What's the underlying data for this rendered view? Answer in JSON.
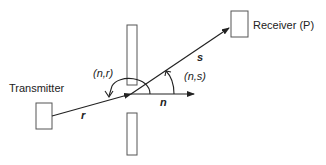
{
  "diagram": {
    "labels": {
      "transmitter": "Transmitter",
      "receiver": "Receiver (P)",
      "vector_r": "r",
      "vector_s": "s",
      "vector_n": "n",
      "angle_nr": "(n,r)",
      "angle_ns": "(n,s)"
    },
    "colors": {
      "stroke": "#222222",
      "box_stroke": "#555555",
      "background": "#ffffff"
    }
  }
}
